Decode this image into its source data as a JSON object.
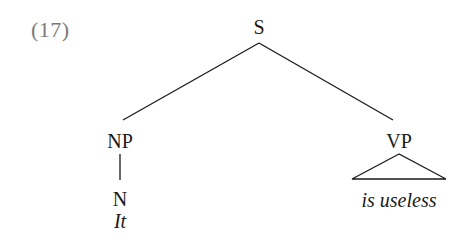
{
  "example": {
    "number": "(17)"
  },
  "tree": {
    "root": {
      "label": "S"
    },
    "subject": {
      "label": "NP",
      "child": {
        "label": "N",
        "word": "It"
      }
    },
    "predicate": {
      "label": "VP",
      "abbreviated": true,
      "words": "is useless"
    }
  }
}
